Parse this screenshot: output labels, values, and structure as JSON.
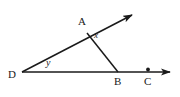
{
  "figure": {
    "type": "geometry-diagram",
    "stroke_color": "#1a1a1a",
    "background_color": "#ffffff",
    "points": [
      {
        "id": "A",
        "label": "A",
        "x": 87,
        "y": 33
      },
      {
        "id": "B",
        "label": "B",
        "x": 118,
        "y": 72
      },
      {
        "id": "C",
        "label": "C",
        "x": 148,
        "y": 70
      },
      {
        "id": "D",
        "label": "D",
        "x": 22,
        "y": 72
      }
    ],
    "angles": [
      {
        "id": "x",
        "label": "x",
        "vertex": "A",
        "x": 97,
        "y": 37
      },
      {
        "id": "y",
        "label": "y",
        "vertex": "D",
        "x": 50,
        "y": 64
      }
    ],
    "segments": [
      {
        "id": "ray-D-upper",
        "from": "D",
        "to": "arrow-upper",
        "arrow_end": true
      },
      {
        "id": "ray-D-horizontal",
        "from": "D",
        "to": "arrow-right",
        "arrow_end": true
      },
      {
        "id": "segment-AB",
        "from": "A",
        "to": "B",
        "arrow_end": false
      }
    ],
    "marked_points": [
      {
        "id": "dot-C",
        "x": 148,
        "y": 70
      }
    ]
  }
}
